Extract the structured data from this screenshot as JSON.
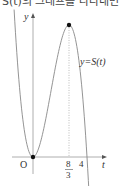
{
  "caption": "S(t)의 그래프를 나타내면",
  "chart_data": {
    "type": "line",
    "title": "",
    "function_label": "y=S(t)",
    "xlabel": "t",
    "ylabel": "y",
    "origin_label": "O",
    "xlim": [
      -1.4,
      5.3
    ],
    "ylim": [
      0,
      10.5
    ],
    "series": [
      {
        "name": "S(t)",
        "formula": "t^2(4-t)",
        "x": [
          -1.4,
          -1.2,
          -1.0,
          -0.8,
          -0.6,
          -0.4,
          -0.2,
          0,
          0.4,
          0.8,
          1.2,
          1.6,
          2.0,
          2.4,
          2.667,
          3.0,
          3.4,
          3.8,
          4.0,
          4.15
        ],
        "values": [
          10.58,
          7.49,
          5.0,
          3.07,
          1.66,
          0.7,
          0.17,
          0,
          0.58,
          2.05,
          4.03,
          6.14,
          8.0,
          9.22,
          9.48,
          9.0,
          6.94,
          2.89,
          0,
          -2.58
        ]
      }
    ],
    "marked_points": [
      {
        "t": 0,
        "y": 0,
        "label": "O"
      },
      {
        "t": 2.667,
        "y": 9.48,
        "label": ""
      }
    ],
    "x_ticks": [
      {
        "value": 2.667,
        "numerator": "8",
        "denominator": "3"
      },
      {
        "value": 4,
        "label": "4"
      }
    ],
    "guides": [
      {
        "type": "dotted-vertical",
        "x": 2.667
      }
    ],
    "grid": false
  }
}
